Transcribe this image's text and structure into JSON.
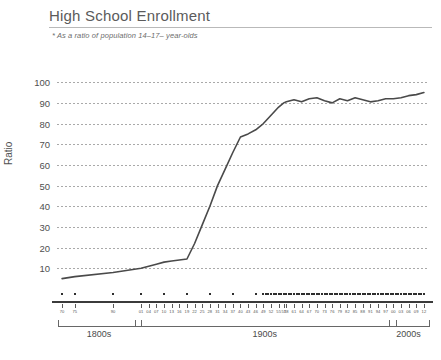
{
  "header": {
    "title": "High School Enrollment",
    "subtitle": "* As a ratio of population 14–17– year-olds"
  },
  "chart_data": {
    "type": "line",
    "title": "High School Enrollment",
    "subtitle": "* As a ratio of population 14–17– year-olds",
    "xlabel": "",
    "ylabel": "Ratio",
    "ylim": [
      0,
      100
    ],
    "yticks": [
      10,
      20,
      30,
      40,
      50,
      60,
      70,
      80,
      90,
      100
    ],
    "grid": true,
    "legend": false,
    "line_color": "#4a4a4a",
    "marker_color": "#2e2e2e",
    "eras": [
      {
        "label": "1800s",
        "start_year": 1870,
        "end_year": 1899
      },
      {
        "label": "1900s",
        "start_year": 1900,
        "end_year": 1999
      },
      {
        "label": "2000s",
        "start_year": 2000,
        "end_year": 2012
      }
    ],
    "xtick_labels": [
      "70",
      "75",
      "90",
      "01",
      "04",
      "07",
      "10",
      "13",
      "16",
      "19",
      "22",
      "25",
      "28",
      "31",
      "34",
      "37",
      "40",
      "43",
      "46",
      "49",
      "52",
      "55",
      "57",
      "58",
      "61",
      "64",
      "67",
      "70",
      "73",
      "76",
      "79",
      "82",
      "85",
      "88",
      "91",
      "94",
      "97",
      "00",
      "03",
      "06",
      "09",
      "12"
    ],
    "x": [
      1870,
      1875,
      1890,
      1901,
      1904,
      1907,
      1910,
      1913,
      1916,
      1919,
      1922,
      1925,
      1928,
      1931,
      1934,
      1937,
      1940,
      1943,
      1946,
      1949,
      1952,
      1955,
      1957,
      1958,
      1961,
      1964,
      1967,
      1970,
      1973,
      1976,
      1979,
      1982,
      1985,
      1988,
      1991,
      1994,
      1997,
      2000,
      2003,
      2006,
      2009,
      2012
    ],
    "values": [
      5,
      6,
      8,
      10,
      11,
      12,
      13,
      13.5,
      14,
      14.5,
      22,
      31,
      40,
      50,
      58,
      66,
      73.5,
      75,
      77,
      80,
      84,
      88,
      90,
      90.5,
      91.5,
      90.5,
      92,
      92.5,
      91,
      90,
      92,
      91,
      92.5,
      91.5,
      90.5,
      91,
      92,
      92,
      92.5,
      93.5,
      94,
      95
    ],
    "marker_years_sparse": [
      1870,
      1875,
      1890,
      1901,
      1910,
      1919,
      1928,
      1937,
      1946
    ],
    "marker_years_dense_start": 1949,
    "marker_years_dense_end": 2012,
    "series_name": "Ratio of 14–17-year-olds enrolled in high school"
  }
}
